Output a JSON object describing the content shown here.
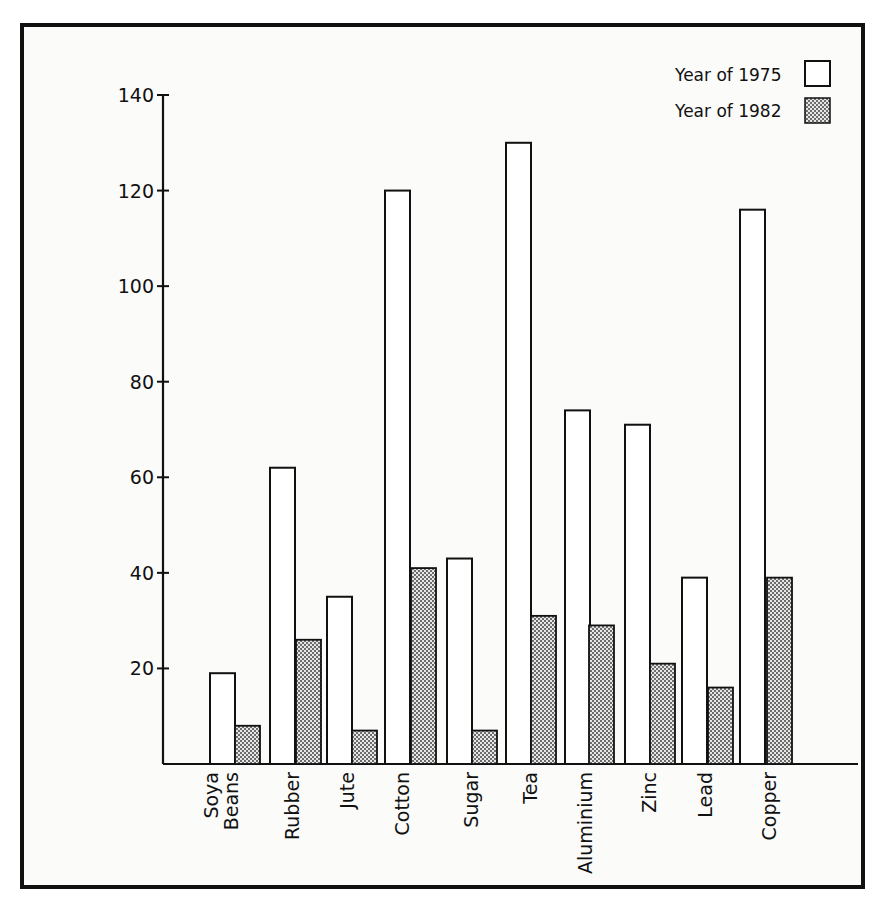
{
  "chart_data": {
    "type": "bar",
    "title": "",
    "xlabel": "",
    "ylabel": "",
    "ylim": [
      0,
      140
    ],
    "yticks": [
      20,
      40,
      60,
      80,
      100,
      120,
      140
    ],
    "grid": false,
    "legend_position": "top-right",
    "categories": [
      "Soya Beans",
      "Rubber",
      "Jute",
      "Cotton",
      "Sugar",
      "Tea",
      "Aluminium",
      "Zinc",
      "Lead",
      "Copper"
    ],
    "category_lines": [
      [
        "Soya",
        "Beans"
      ],
      [
        "Rubber"
      ],
      [
        "Jute"
      ],
      [
        "Cotton"
      ],
      [
        "Sugar"
      ],
      [
        "Tea"
      ],
      [
        "Aluminium"
      ],
      [
        "Zinc"
      ],
      [
        "Lead"
      ],
      [
        "Copper"
      ]
    ],
    "series": [
      {
        "name": "Year of 1975",
        "pattern": "open",
        "values": [
          19,
          62,
          35,
          120,
          43,
          130,
          74,
          71,
          39,
          116
        ]
      },
      {
        "name": "Year of 1982",
        "pattern": "dotted",
        "values": [
          8,
          26,
          7,
          41,
          7,
          31,
          29,
          21,
          16,
          39
        ]
      }
    ],
    "colors": {
      "ink": "#111111",
      "open_fill": "#ffffff",
      "dot_fill": "#d9d9d9",
      "dot_ink": "#333333"
    }
  }
}
